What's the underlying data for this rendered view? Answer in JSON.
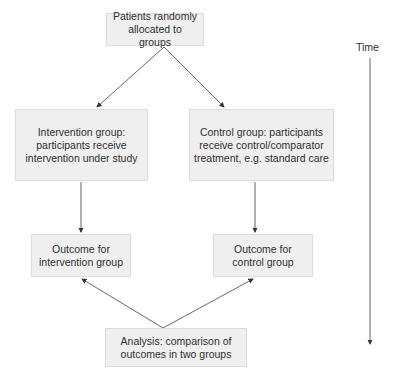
{
  "diagram": {
    "nodes": {
      "randomisation": "Patients randomly\nallocated to groups",
      "intervention_group": "Intervention group:\nparticipants receive\nintervention under study",
      "control_group": "Control group: participants\nreceive control/comparator\ntreatment, e.g. standard care",
      "outcome_intervention": "Outcome for\nintervention group",
      "outcome_control": "Outcome for\ncontrol group",
      "analysis": "Analysis: comparison of\noutcomes in two groups"
    },
    "time_axis": {
      "label": "Time"
    },
    "colors": {
      "box_fill": "#efefef",
      "box_border": "#dcdcdc",
      "line": "#555555",
      "text": "#2f2f2f"
    }
  }
}
